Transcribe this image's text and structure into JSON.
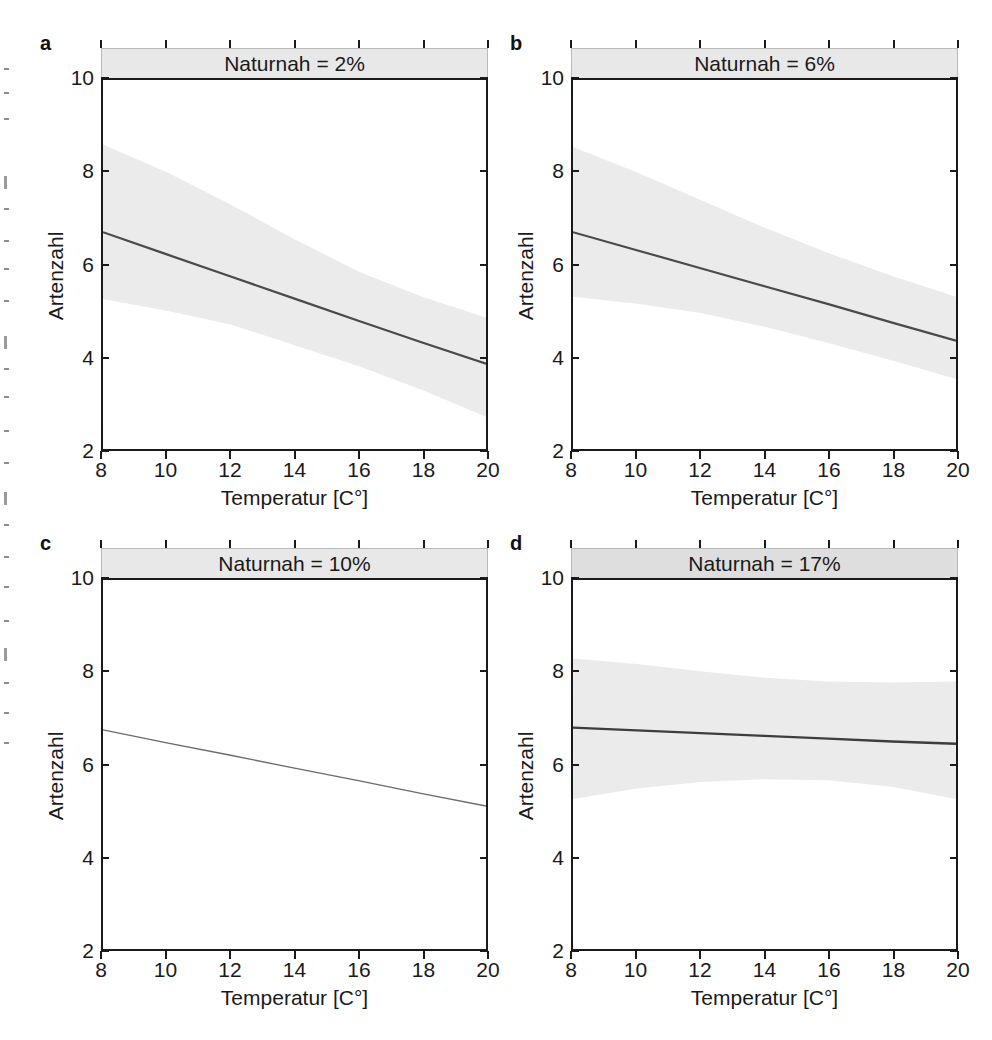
{
  "figure": {
    "panel_letters": [
      "a",
      "b",
      "c",
      "d"
    ],
    "x_axis_title": "Temperatur [C°]",
    "y_axis_title": "Artenzahl",
    "x_ticks": [
      "8",
      "10",
      "12",
      "14",
      "16",
      "18",
      "20"
    ],
    "y_ticks": [
      "2",
      "4",
      "6",
      "8",
      "10"
    ],
    "colors": {
      "line": "#4a4a4a",
      "band": "#ebebeb",
      "strip_fill": "#e8e8e8",
      "strip_fill_dark": "#dedede",
      "axis": "#1a1a1a",
      "background": "#ffffff"
    }
  },
  "panels": [
    {
      "letter": "a",
      "strip_label": "Naturnah = 2%"
    },
    {
      "letter": "b",
      "strip_label": "Naturnah = 6%"
    },
    {
      "letter": "c",
      "strip_label": "Naturnah = 10%"
    },
    {
      "letter": "d",
      "strip_label": "Naturnah = 17%"
    }
  ],
  "chart_data": {
    "type": "line",
    "xlabel": "Temperatur [C°]",
    "ylabel": "Artenzahl",
    "xlim": [
      8,
      20
    ],
    "ylim": [
      2,
      10
    ],
    "x_ticks": [
      8,
      10,
      12,
      14,
      16,
      18,
      20
    ],
    "y_ticks": [
      2,
      4,
      6,
      8,
      10
    ],
    "grid": false,
    "legend": "none",
    "panel_variable": "Naturnah",
    "band_description": "95% confidence ribbon (light grey) around fitted regression line",
    "panels": [
      {
        "letter": "a",
        "strip_label": "Naturnah = 2%",
        "naturnah_percent": 2,
        "x": [
          8,
          10,
          12,
          14,
          16,
          18,
          20
        ],
        "fit": [
          6.7,
          6.22,
          5.74,
          5.26,
          4.78,
          4.31,
          3.85
        ],
        "band_lower": [
          5.25,
          5.0,
          4.7,
          4.25,
          3.8,
          3.28,
          2.7
        ],
        "band_upper": [
          8.6,
          8.0,
          7.3,
          6.55,
          5.85,
          5.3,
          4.85
        ],
        "band_visible": true
      },
      {
        "letter": "b",
        "strip_label": "Naturnah = 6%",
        "naturnah_percent": 6,
        "x": [
          8,
          10,
          12,
          14,
          16,
          18,
          20
        ],
        "fit": [
          6.7,
          6.31,
          5.92,
          5.53,
          5.14,
          4.74,
          4.35
        ],
        "band_lower": [
          5.3,
          5.15,
          4.95,
          4.65,
          4.3,
          3.92,
          3.52
        ],
        "band_upper": [
          8.55,
          8.0,
          7.4,
          6.8,
          6.25,
          5.75,
          5.3
        ],
        "band_visible": true
      },
      {
        "letter": "c",
        "strip_label": "Naturnah = 10%",
        "naturnah_percent": 10,
        "x": [
          8,
          10,
          12,
          14,
          16,
          18,
          20
        ],
        "fit": [
          6.75,
          6.47,
          6.2,
          5.92,
          5.65,
          5.37,
          5.1
        ],
        "band_lower": [
          6.75,
          6.47,
          6.2,
          5.92,
          5.65,
          5.37,
          5.1
        ],
        "band_upper": [
          6.75,
          6.47,
          6.2,
          5.92,
          5.65,
          5.37,
          5.1
        ],
        "band_visible": false
      },
      {
        "letter": "d",
        "strip_label": "Naturnah = 17%",
        "naturnah_percent": 17,
        "x": [
          8,
          10,
          12,
          14,
          16,
          18,
          20
        ],
        "fit": [
          6.8,
          6.74,
          6.68,
          6.62,
          6.56,
          6.5,
          6.45
        ],
        "band_lower": [
          5.25,
          5.48,
          5.62,
          5.68,
          5.66,
          5.52,
          5.25
        ],
        "band_upper": [
          8.3,
          8.18,
          8.02,
          7.88,
          7.8,
          7.78,
          7.8
        ],
        "band_visible": true
      }
    ]
  }
}
